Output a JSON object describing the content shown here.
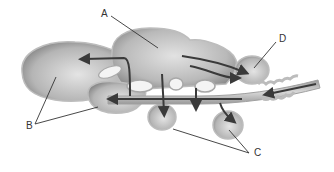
{
  "diagram": {
    "type": "anatomical-structure",
    "colors": {
      "body_fill_light": "#d9d9d9",
      "body_fill_dark": "#8f8f8f",
      "outline": "#b0b0b0",
      "arrow": "#3a3a3a",
      "leader_line": "#333333",
      "background": "#ffffff"
    },
    "labels": [
      {
        "id": "A",
        "text": "A"
      },
      {
        "id": "B",
        "text": "B"
      },
      {
        "id": "C",
        "text": "C"
      },
      {
        "id": "D",
        "text": "D"
      }
    ]
  }
}
